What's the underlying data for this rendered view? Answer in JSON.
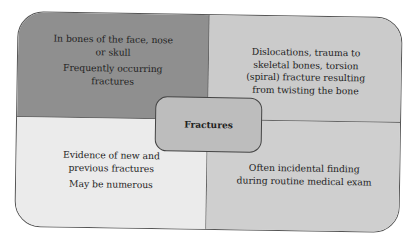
{
  "diagram": {
    "center": {
      "label": "Fractures"
    },
    "quadrants": {
      "top_left": {
        "lines": [
          "In bones of the face, nose or skull",
          "Frequently occurring fractures"
        ],
        "color": "#8f8f8f"
      },
      "top_right": {
        "lines": [
          "Dislocations, trauma to skeletal bones, torsion (spiral) fracture resulting from twisting the bone"
        ],
        "color": "#cbcbcb"
      },
      "bottom_left": {
        "lines": [
          "Evidence of new and previous fractures",
          "May be numerous"
        ],
        "color": "#ebebeb"
      },
      "bottom_right": {
        "lines": [
          "Often incidental finding during routine medical exam"
        ],
        "color": "#cfcfcf"
      }
    }
  }
}
